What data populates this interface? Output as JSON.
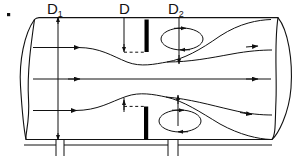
{
  "figure": {
    "type": "engineering-diagram",
    "marker": "▪",
    "labels": {
      "inlet_diameter": "D",
      "inlet_diameter_subscript": "1",
      "orifice_diameter": "D",
      "orifice_diameter_subscript": "",
      "vena_contracta_diameter": "D",
      "vena_contracta_subscript": "2"
    },
    "colors": {
      "line": "#111111",
      "plate": "#000000",
      "background": "#ffffff"
    },
    "elements": {
      "pipe": "pipe-body-outline",
      "left_end": "pipe-left-end-ellipse",
      "right_end": "pipe-right-end-ellipse",
      "plate_top": "orifice-plate-upper",
      "plate_bottom": "orifice-plate-lower",
      "eddy_top": "recirculation-eddy-upper",
      "eddy_bottom": "recirculation-eddy-lower",
      "streamlines": 3,
      "dimension_lines": 3
    }
  }
}
